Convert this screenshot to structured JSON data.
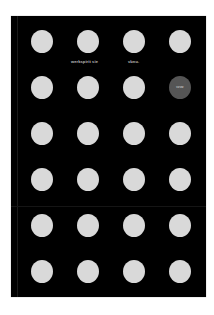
{
  "cover": {
    "background": "#000000",
    "dot_color": "#d9d9d9",
    "highlight_color": "#555555",
    "rows": 6,
    "columns": 4
  },
  "captions": {
    "left": "werkspirit sie",
    "right": "vbnu."
  },
  "highlight_dot": {
    "row": 2,
    "column": 4,
    "label": "vzvw"
  }
}
